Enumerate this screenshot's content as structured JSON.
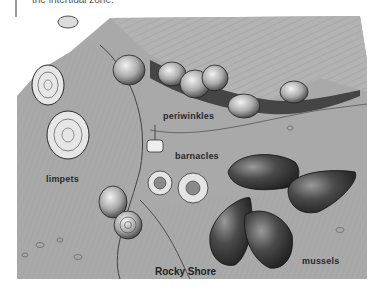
{
  "header": {
    "caption_text": "the intertidal zone."
  },
  "figure": {
    "title": "Rocky Shore",
    "labels": {
      "periwinkles": "periwinkles",
      "limpets": "limpets",
      "barnacles": "barnacles",
      "mussels": "mussels"
    },
    "colors": {
      "rock": "#a8a8a8",
      "rock_light": "#bdbdbd",
      "rock_dark": "#6e6e6e",
      "crevice": "#3a3a3a",
      "shell_light": "#d8d8d8",
      "mussel": "#3c3c3c"
    }
  }
}
